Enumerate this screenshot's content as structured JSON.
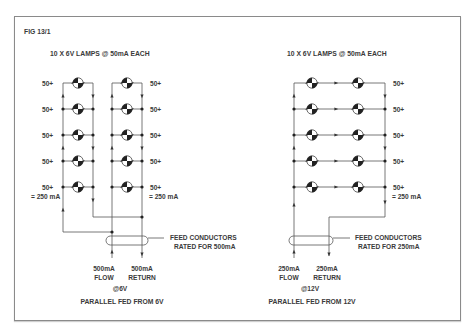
{
  "figure": {
    "label": "FIG 13/1"
  },
  "left_circuit": {
    "title": "10 X 6V LAMPS @ 50mA EACH",
    "lamp_labels_left": [
      "50+",
      "50+",
      "50+",
      "50+",
      "50+"
    ],
    "lamp_labels_right": [
      "50+",
      "50+",
      "50+",
      "50+",
      "50+"
    ],
    "total_left": "= 250 mA",
    "total_right": "= 250 mA",
    "feed_note_line1": "FEED CONDUCTORS",
    "feed_note_line2": "RATED FOR 500mA",
    "flow_current": "500mA",
    "flow_label": "FLOW",
    "return_current": "500mA",
    "return_label": "RETURN",
    "voltage": "@6V",
    "caption": "PARALLEL FED FROM 6V"
  },
  "right_circuit": {
    "title": "10 X 6V LAMPS @ 50mA EACH",
    "lamp_labels": [
      "50+",
      "50+",
      "50+",
      "50+",
      "50+"
    ],
    "total": "= 250 mA",
    "feed_note_line1": "FEED CONDUCTORS",
    "feed_note_line2": "RATED FOR 250mA",
    "flow_current": "250mA",
    "flow_label": "FLOW",
    "return_current": "250mA",
    "return_label": "RETURN",
    "voltage": "@12V",
    "caption": "PARALLEL FED FROM 12V"
  },
  "colors": {
    "line": "#555555",
    "text": "#3a3a3a",
    "frame": "#8a8a8a"
  }
}
